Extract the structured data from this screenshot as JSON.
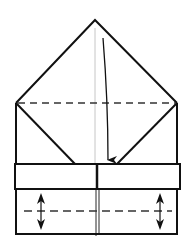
{
  "diagram": {
    "type": "origami-fold-step",
    "background": "#ffffff",
    "stroke_color": "#111111",
    "guide_color": "#b8b8b8"
  },
  "shapes": {
    "apex": [
      95,
      20
    ],
    "left_corner": [
      16,
      103
    ],
    "right_corner": [
      177,
      103
    ],
    "valley_fold_upper_y": 103,
    "band": {
      "x": 15,
      "y": 164,
      "width": 165,
      "height": 25
    },
    "body_bottom_y": 234,
    "center_seam_x": 97,
    "lower_dashed_y": 211,
    "inner_flap_left_end": [
      75,
      164
    ],
    "inner_flap_right_end": [
      117,
      164
    ]
  },
  "arrows": {
    "fold_down": {
      "from": [
        103,
        38
      ],
      "to": [
        108,
        164
      ]
    },
    "pleat_left_x": 41,
    "pleat_right_x": 160,
    "pleat_y_top": 194,
    "pleat_y_bottom": 229
  }
}
